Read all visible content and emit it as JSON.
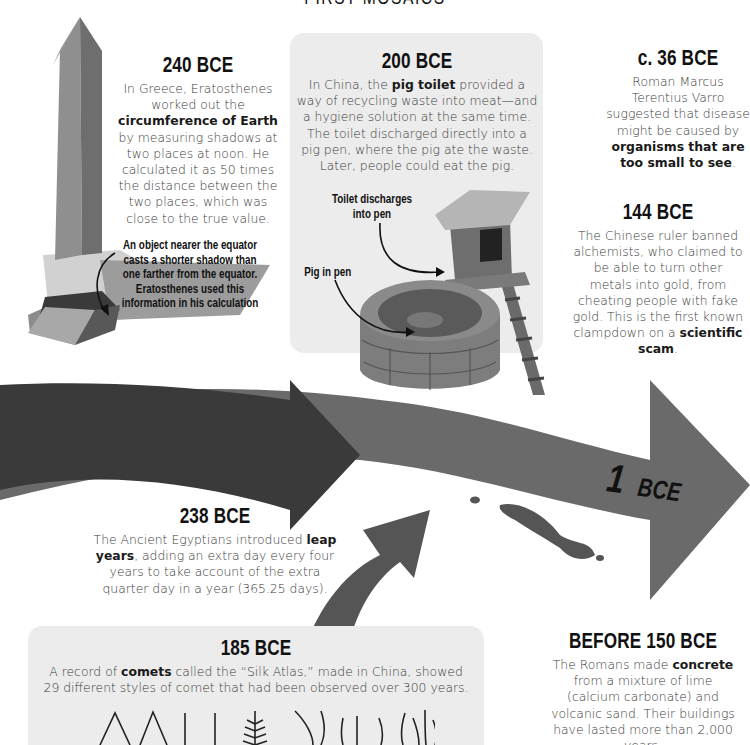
{
  "page": {
    "title_partial": "FIRST MOSAICS"
  },
  "colors": {
    "panel_gray": "#ececec",
    "arrow_dark": "#3a3a3a",
    "arrow_mid": "#6a6a6a",
    "text": "#3a3a3a",
    "heading": "#111111"
  },
  "entries": {
    "e240": {
      "date": "240 BCE",
      "text_pre": "In Greece, Eratosthenes worked out the ",
      "bold": "circumference of Earth",
      "text_post": " by measuring shadows at two places at noon. He calculated it as 50 times the distance between the two places, which was close to the true value.",
      "callout": "An object nearer the equator casts a shorter shadow than one farther from the equator. Eratosthenes used this information in his calculation",
      "image": "obelisk-illustration"
    },
    "e200": {
      "date": "200 BCE",
      "text_pre": "In China, the ",
      "bold": "pig toilet",
      "text_post": " provided a way of recycling waste into meat—and a hygiene solution at the same time. The toilet discharged directly into a pig pen, where the pig ate the waste. Later, people could eat the pig.",
      "callout_toilet": "Toilet discharges into pen",
      "callout_pig": "Pig in pen",
      "image": "pig-toilet-illustration"
    },
    "e36": {
      "date": "c. 36 BCE",
      "text_pre": "Roman Marcus Terentius Varro suggested that disease might be caused by ",
      "bold": "organisms that are too small to see",
      "text_post": "."
    },
    "e144": {
      "date": "144 BCE",
      "text_pre": "The Chinese ruler banned alchemists, who claimed to be able to turn other metals into gold, from cheating people with fake gold. This is the first known clampdown on a ",
      "bold": "scientific scam",
      "text_post": "."
    },
    "e1": {
      "date_num": "1",
      "date_suffix": "BCE"
    },
    "e238": {
      "date": "238 BCE",
      "bold": "leap years",
      "text_pre": "The Ancient Egyptians introduced ",
      "text_post": ", adding an extra day every four years to take account of the extra quarter day in a year (365.25 days)."
    },
    "e185": {
      "date": "185 BCE",
      "text_pre": "A record of ",
      "bold": "comets",
      "text_post": " called the “Silk Atlas,” made in China, showed 29 different styles of comet that had been observed over 300 years.",
      "image": "comet-styles-drawings"
    },
    "e150": {
      "date": "BEFORE 150 BCE",
      "text_pre": "The Romans made ",
      "bold": "concrete",
      "text_post": " from a mixture of lime (calcium carbonate) and volcanic sand. Their buildings have lasted more than 2,000 years."
    }
  }
}
